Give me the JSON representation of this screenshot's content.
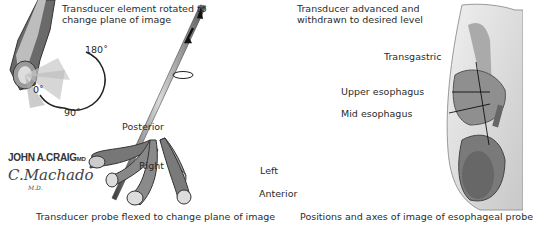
{
  "figure": {
    "panels": [
      {
        "id": "rotation",
        "label": "Transducer element rotated to change plane of image",
        "label_lines": [
          "Transducer element rotated to",
          "change plane of image"
        ],
        "angles": [
          "180˚",
          "0˚",
          "90˚"
        ]
      },
      {
        "id": "advance",
        "label_lines": [
          "Transducer advanced and",
          "withdrawn to desired level"
        ],
        "flex_labels": [
          "Posterior",
          "Right",
          "Left",
          "Anterior"
        ],
        "caption": "Transducer probe flexed to change plane of image"
      },
      {
        "id": "positions",
        "levels": [
          "Transgastric",
          "Upper esophagus",
          "Mid esophagus"
        ],
        "caption": "Positions and axes of image of esophageal probe"
      }
    ],
    "signature": {
      "line1": "JOHN A.CRAIG",
      "line1_suffix": "MD",
      "line2": "C.Machado",
      "line3": "M.D."
    },
    "colors": {
      "probe_dark": "#3a3a3a",
      "probe_mid": "#8a8a8a",
      "probe_light": "#d8d8d8",
      "anatomy_bg": "#e4e4e4",
      "text": "#2b2b2b"
    }
  }
}
